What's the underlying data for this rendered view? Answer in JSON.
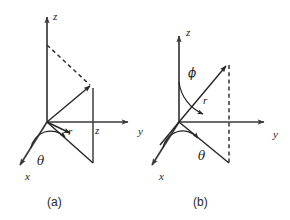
{
  "figure": {
    "background_color": "#ffffff",
    "line_color": "#262626",
    "axis_color": "#3a3a3a",
    "panels": [
      {
        "id": "a",
        "caption": "(a)",
        "system_name": "cylindrical-coordinates",
        "axis_labels": {
          "x": "x",
          "y": "y",
          "z": "z"
        },
        "annotations": {
          "radial": "r",
          "height": "z",
          "azimuth": "θ"
        }
      },
      {
        "id": "b",
        "caption": "(b)",
        "system_name": "spherical-coordinates",
        "axis_labels": {
          "x": "x",
          "y": "y",
          "z": "z"
        },
        "annotations": {
          "radial": "r",
          "polar": "ϕ",
          "azimuth": "θ"
        }
      }
    ]
  }
}
